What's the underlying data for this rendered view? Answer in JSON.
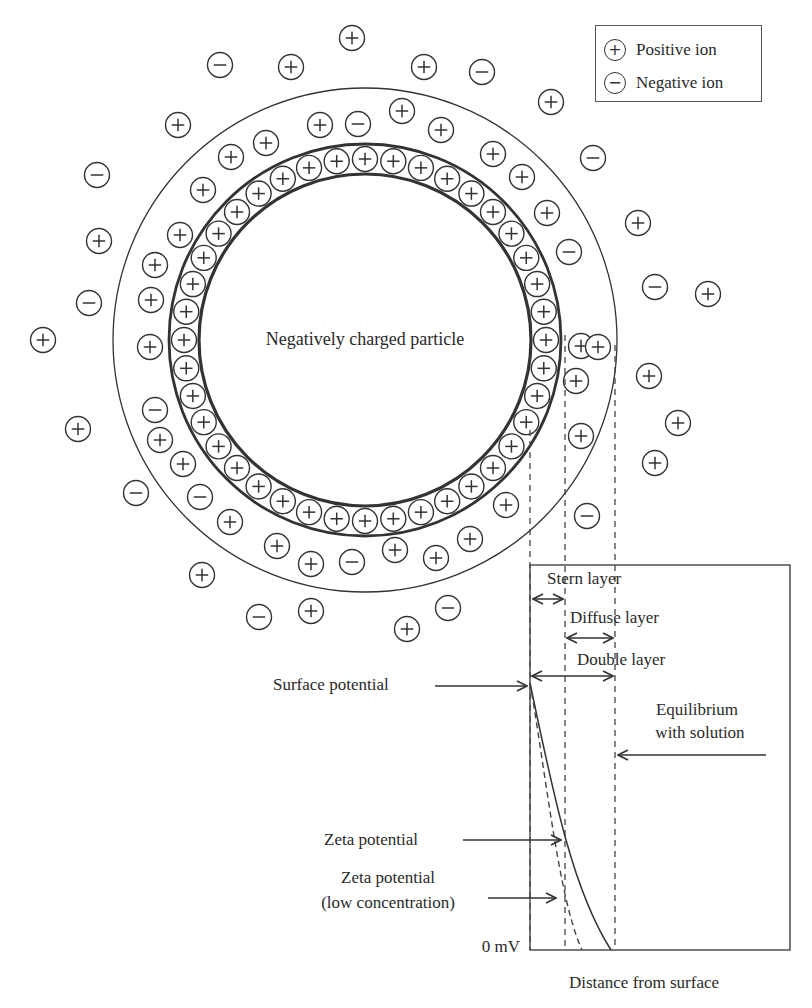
{
  "legend": {
    "items": [
      {
        "symbol": "+",
        "icon": "positive-ion-icon",
        "label": "Positive ion"
      },
      {
        "symbol": "−",
        "icon": "negative-ion-icon",
        "label": "Negative ion"
      }
    ]
  },
  "particle": {
    "label": "Negatively charged particle",
    "center": [
      365,
      340
    ],
    "inner_radius": 166,
    "stern_outer_radius": 196,
    "diffuse_outer_radius": 252,
    "stern_ion_count": 40
  },
  "free_ions": [
    {
      "x": 352,
      "y": 38,
      "s": "+"
    },
    {
      "x": 220,
      "y": 65,
      "s": "-"
    },
    {
      "x": 291,
      "y": 67,
      "s": "+"
    },
    {
      "x": 424,
      "y": 67,
      "s": "+"
    },
    {
      "x": 482,
      "y": 72,
      "s": "-"
    },
    {
      "x": 551,
      "y": 102,
      "s": "+"
    },
    {
      "x": 178,
      "y": 125,
      "s": "+"
    },
    {
      "x": 97,
      "y": 175,
      "s": "-"
    },
    {
      "x": 593,
      "y": 158,
      "s": "-"
    },
    {
      "x": 638,
      "y": 223,
      "s": "+"
    },
    {
      "x": 99,
      "y": 241,
      "s": "+"
    },
    {
      "x": 89,
      "y": 303,
      "s": "-"
    },
    {
      "x": 655,
      "y": 287,
      "s": "-"
    },
    {
      "x": 708,
      "y": 294,
      "s": "+"
    },
    {
      "x": 43,
      "y": 340,
      "s": "+"
    },
    {
      "x": 649,
      "y": 376,
      "s": "+"
    },
    {
      "x": 678,
      "y": 423,
      "s": "+"
    },
    {
      "x": 78,
      "y": 429,
      "s": "+"
    },
    {
      "x": 655,
      "y": 463,
      "s": "+"
    },
    {
      "x": 136,
      "y": 493,
      "s": "-"
    },
    {
      "x": 202,
      "y": 575,
      "s": "+"
    },
    {
      "x": 259,
      "y": 617,
      "s": "-"
    },
    {
      "x": 311,
      "y": 611,
      "s": "+"
    },
    {
      "x": 407,
      "y": 629,
      "s": "+"
    },
    {
      "x": 448,
      "y": 608,
      "s": "-"
    }
  ],
  "diffuse_ions": [
    {
      "x": 231,
      "y": 157,
      "s": "+"
    },
    {
      "x": 266,
      "y": 143,
      "s": "+"
    },
    {
      "x": 320,
      "y": 125,
      "s": "+"
    },
    {
      "x": 358,
      "y": 124,
      "s": "-"
    },
    {
      "x": 402,
      "y": 111,
      "s": "+"
    },
    {
      "x": 441,
      "y": 130,
      "s": "+"
    },
    {
      "x": 493,
      "y": 154,
      "s": "+"
    },
    {
      "x": 522,
      "y": 177,
      "s": "+"
    },
    {
      "x": 547,
      "y": 213,
      "s": "+"
    },
    {
      "x": 569,
      "y": 252,
      "s": "-"
    },
    {
      "x": 203,
      "y": 190,
      "s": "+"
    },
    {
      "x": 180,
      "y": 235,
      "s": "+"
    },
    {
      "x": 155,
      "y": 265,
      "s": "+"
    },
    {
      "x": 151,
      "y": 300,
      "s": "+"
    },
    {
      "x": 150,
      "y": 347,
      "s": "+"
    },
    {
      "x": 581,
      "y": 346,
      "s": "+"
    },
    {
      "x": 598,
      "y": 347,
      "s": "+"
    },
    {
      "x": 576,
      "y": 381,
      "s": "+"
    },
    {
      "x": 581,
      "y": 436,
      "s": "+"
    },
    {
      "x": 155,
      "y": 410,
      "s": "-"
    },
    {
      "x": 160,
      "y": 440,
      "s": "+"
    },
    {
      "x": 183,
      "y": 464,
      "s": "+"
    },
    {
      "x": 200,
      "y": 497,
      "s": "-"
    },
    {
      "x": 230,
      "y": 522,
      "s": "+"
    },
    {
      "x": 277,
      "y": 546,
      "s": "+"
    },
    {
      "x": 311,
      "y": 564,
      "s": "+"
    },
    {
      "x": 352,
      "y": 562,
      "s": "-"
    },
    {
      "x": 395,
      "y": 550,
      "s": "+"
    },
    {
      "x": 436,
      "y": 558,
      "s": "+"
    },
    {
      "x": 470,
      "y": 539,
      "s": "+"
    },
    {
      "x": 506,
      "y": 505,
      "s": "+"
    },
    {
      "x": 587,
      "y": 516,
      "s": "-"
    }
  ],
  "graph": {
    "box": {
      "x1": 530,
      "y1": 565,
      "x2": 790,
      "y2": 950
    },
    "dashed_lines_x": [
      530,
      565,
      615
    ],
    "dashed_lines_top_y": 440,
    "labels": {
      "stern_layer": "Stern layer",
      "diffuse_layer": "Diffuse layer",
      "double_layer": "Double layer",
      "surface_potential": "Surface potential",
      "equilibrium_line1": "Equilibrium",
      "equilibrium_line2": "with solution",
      "zeta_potential": "Zeta potential",
      "zeta_low_line1": "Zeta potential",
      "zeta_low_line2": "(low concentration)",
      "zero_mv": "0 mV",
      "x_axis": "Distance from surface"
    }
  },
  "chart_data": {
    "type": "line",
    "title": "",
    "xlabel": "Distance from surface",
    "ylabel": "",
    "y_tick_labels": [
      "0 mV"
    ],
    "series": [
      {
        "name": "Potential (normal concentration)",
        "style": "solid",
        "description": "Decays from surface potential at the particle surface, through the zeta potential at the Stern/diffuse boundary, to 0 mV at the edge of the double layer"
      },
      {
        "name": "Potential (low concentration)",
        "style": "dashed",
        "description": "Steeper decay; reaches a lower zeta potential and 0 mV before the double layer edge"
      }
    ],
    "annotations": [
      "Surface potential",
      "Zeta potential",
      "Zeta potential (low concentration)",
      "Equilibrium with solution",
      "Stern layer",
      "Diffuse layer",
      "Double layer"
    ]
  }
}
